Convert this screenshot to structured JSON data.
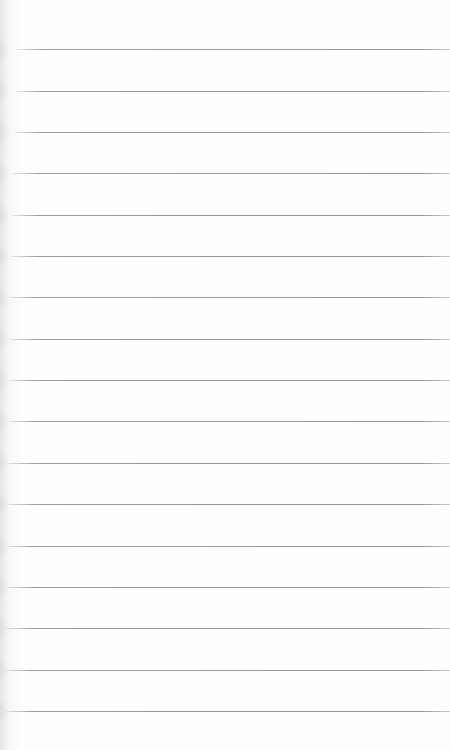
{
  "page": {
    "type": "lined-notepad",
    "background_color": "#fefefe",
    "rule_color": "#9a9a9a",
    "rules": [
      {
        "y": 49,
        "x_start": 17
      },
      {
        "y": 91,
        "x_start": 16
      },
      {
        "y": 132,
        "x_start": 15
      },
      {
        "y": 173,
        "x_start": 13
      },
      {
        "y": 215,
        "x_start": 12
      },
      {
        "y": 256,
        "x_start": 11
      },
      {
        "y": 297,
        "x_start": 10
      },
      {
        "y": 339,
        "x_start": 10
      },
      {
        "y": 380,
        "x_start": 9
      },
      {
        "y": 421,
        "x_start": 9
      },
      {
        "y": 463,
        "x_start": 8
      },
      {
        "y": 504,
        "x_start": 8
      },
      {
        "y": 546,
        "x_start": 7
      },
      {
        "y": 587,
        "x_start": 7
      },
      {
        "y": 628,
        "x_start": 6
      },
      {
        "y": 670,
        "x_start": 6
      },
      {
        "y": 711,
        "x_start": 6
      }
    ]
  }
}
